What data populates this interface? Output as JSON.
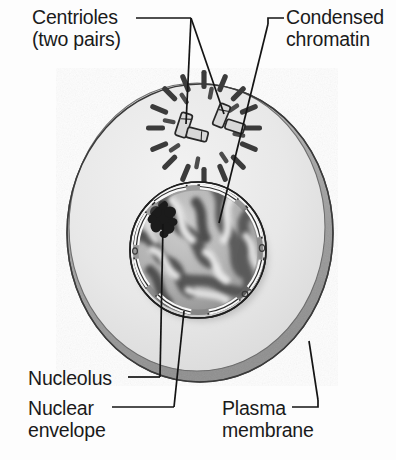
{
  "figure": {
    "background_color": "#fdfdfd",
    "line_color": "#1a1a1a",
    "cell": {
      "name": "cell-body",
      "fill_color": "#e9e9e9",
      "rim_shadow_color": "#9a9a9a",
      "outline_color": "#3a3a3a",
      "center_x": 200,
      "center_y": 230,
      "radius_x": 132,
      "radius_y": 148
    },
    "nucleus": {
      "name": "nucleus",
      "fill_color": "#b9b9b9",
      "envelope_color": "#f4f4f4",
      "envelope_outline": "#2a2a2a",
      "center_x": 198,
      "center_y": 250,
      "radius": 68
    },
    "nucleolus": {
      "name": "nucleolus",
      "color": "#1c1c1c",
      "center_x": 163,
      "center_y": 218
    },
    "centrosomes": [
      {
        "name": "centriole-pair-left",
        "center_x": 186,
        "center_y": 126,
        "spoke_count": 16,
        "spoke_color": "#3b3b3b"
      },
      {
        "name": "centriole-pair-right",
        "center_x": 223,
        "center_y": 117,
        "spoke_count": 16,
        "spoke_color": "#3b3b3b"
      }
    ]
  },
  "labels": {
    "centrioles": {
      "line1": "Centrioles",
      "line2": "(two pairs)",
      "text": "Centrioles\n(two pairs)"
    },
    "condensed_chromatin": {
      "line1": "Condensed",
      "line2": "chromatin",
      "text": "Condensed\nchromatin"
    },
    "nucleolus": {
      "line1": "Nucleolus",
      "text": "Nucleolus"
    },
    "nuclear_envelope": {
      "line1": "Nuclear",
      "line2": "envelope",
      "text": "Nuclear\nenvelope"
    },
    "plasma_membrane": {
      "line1": "Plasma",
      "line2": "membrane",
      "text": "Plasma\nmembrane"
    }
  },
  "leader_lines": [
    {
      "name": "leader-centrioles-to-left-pair",
      "from_label": "centrioles"
    },
    {
      "name": "leader-centrioles-to-right-pair",
      "from_label": "centrioles"
    },
    {
      "name": "leader-chromatin",
      "from_label": "condensed_chromatin"
    },
    {
      "name": "leader-nucleolus",
      "from_label": "nucleolus"
    },
    {
      "name": "leader-nuclear-envelope",
      "from_label": "nuclear_envelope"
    },
    {
      "name": "leader-plasma-membrane",
      "from_label": "plasma_membrane"
    }
  ]
}
